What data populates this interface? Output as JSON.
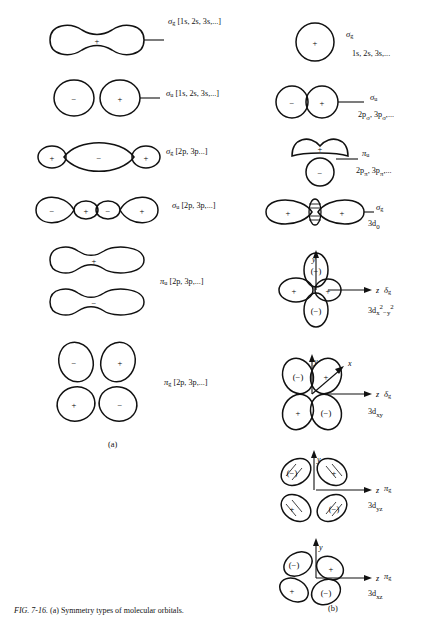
{
  "figure": {
    "caption_label": "FIG. 7-16.",
    "caption_text": "(a) Symmetry types of molecular orbitals.",
    "panel_a": "(a)",
    "panel_b": "(b)"
  },
  "colors": {
    "ink": "#111111",
    "background": "#ffffff"
  },
  "column_a": {
    "title": "(a)",
    "entries": [
      {
        "id": "a1",
        "shape": "sigma-g-peanut",
        "symmetry": "σ",
        "subscript": "g",
        "label": "σg [1s, 2s, 3s,...]",
        "basis": "[1s, 2s, 3s,...]",
        "lobes": [
          "+"
        ]
      },
      {
        "id": "a2",
        "shape": "sigma-u-two-circles",
        "symmetry": "σ",
        "subscript": "u",
        "label": "σu [1s, 2s, 3s,...]",
        "basis": "[1s, 2s, 3s,...]",
        "lobes": [
          "−",
          "+"
        ]
      },
      {
        "id": "a3",
        "shape": "sigma-g-three-lobe",
        "symmetry": "σ",
        "subscript": "g",
        "label": "σg [2p, 3p...]",
        "basis": "[2p, 3p...]",
        "lobes": [
          "+",
          "−",
          "+"
        ]
      },
      {
        "id": "a4",
        "shape": "sigma-u-four-lobe",
        "symmetry": "σ",
        "subscript": "u",
        "label": "σu [2p, 3p,...]",
        "basis": "[2p, 3p,...]",
        "lobes": [
          "−",
          "+",
          "−",
          "+"
        ]
      },
      {
        "id": "a5",
        "shape": "pi-u-two-peanuts",
        "symmetry": "π",
        "subscript": "u",
        "label": "πu [2p, 3p,...]",
        "basis": "[2p, 3p,...]",
        "lobes": [
          "+",
          "−"
        ]
      },
      {
        "id": "a6",
        "shape": "pi-g-four-lobe",
        "symmetry": "π",
        "subscript": "g",
        "label": "πg [2p, 3p,...]",
        "basis": "[2p, 3p,...]",
        "lobes": [
          "−",
          "+",
          "+",
          "−"
        ]
      }
    ]
  },
  "column_b": {
    "title": "(b)",
    "entries": [
      {
        "id": "b1",
        "shape": "single-circle",
        "symmetry": "σ",
        "subscript": "g",
        "orbital": "1s, 2s, 3s,...",
        "lobes": [
          "+"
        ],
        "axes": []
      },
      {
        "id": "b2",
        "shape": "two-circles",
        "symmetry": "σ",
        "subscript": "u",
        "orbital": "2pσ, 3pσ,...",
        "lobes": [
          "−",
          "+"
        ],
        "axes": []
      },
      {
        "id": "b3",
        "shape": "pi-stacked-circles",
        "symmetry": "π",
        "subscript": "u",
        "orbital": "2pπ, 3pπ,...",
        "lobes": [
          "+",
          "−"
        ],
        "axes": []
      },
      {
        "id": "b4",
        "shape": "sigma-g-3d0",
        "symmetry": "σ",
        "subscript": "g",
        "orbital": "3d0",
        "lobes": [
          "+",
          "−",
          "+"
        ],
        "axes": []
      },
      {
        "id": "b5",
        "shape": "delta-g-x2y2",
        "symmetry": "δ",
        "subscript": "g",
        "orbital": "3dx²−y²",
        "lobes": [
          "(−)",
          "+",
          "+",
          "(−)"
        ],
        "axes": [
          "y",
          "z"
        ]
      },
      {
        "id": "b6",
        "shape": "delta-g-xy",
        "symmetry": "δ",
        "subscript": "g",
        "orbital": "3dxy",
        "lobes": [
          "(−)",
          "+",
          "+",
          "(−)"
        ],
        "axes": [
          "y",
          "x",
          "z"
        ]
      },
      {
        "id": "b7",
        "shape": "pi-g-yz",
        "symmetry": "π",
        "subscript": "g",
        "orbital": "3dyz",
        "lobes": [
          "(−)",
          "+",
          "+",
          "(−)"
        ],
        "axes": [
          "y",
          "z"
        ]
      },
      {
        "id": "b8",
        "shape": "pi-g-xz",
        "symmetry": "π",
        "subscript": "g",
        "orbital": "3dxz",
        "lobes": [
          "(−)",
          "+",
          "+",
          "(−)"
        ],
        "axes": [
          "y",
          "z"
        ]
      }
    ]
  }
}
